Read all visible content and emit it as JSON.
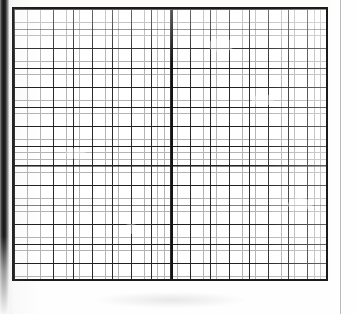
{
  "document": {
    "kind": "scanned-graph-paper",
    "title": "Blank graph paper sheet",
    "text_content": "",
    "visible_labels": [],
    "notes": "No text, numbers, axis ticks, legend or annotations are printed anywhere on this page."
  },
  "chart_data": {
    "type": "table",
    "title": "",
    "subtitle": "",
    "xlabel": "",
    "ylabel": "",
    "categories": [],
    "values": [],
    "series": [],
    "annotations": [],
    "legend_entries": [],
    "legend_position": "none",
    "grid": "on",
    "grid_description": "Empty ruled graph paper: no plotted data, curves, points or bars are present.",
    "minor_cells_horizontal": 48,
    "minor_cells_vertical": 42,
    "major_cells_horizontal": 16,
    "major_cells_vertical": 14,
    "minor_pitch_px": 6.52,
    "major_pitch_px": 19.56,
    "heavy_vertical_rule_x_px": 171
  },
  "page": {
    "width_px": 356,
    "height_px": 314,
    "background_hex": "#fdfdfc"
  },
  "grid_block": {
    "left_px": 12,
    "top_px": 7,
    "width_px": 316,
    "height_px": 274,
    "border_hex": "#1b1b1b",
    "border_width_px": 2,
    "minor_line_hex": "#b4b4b4",
    "major_line_hex": "#2a2a2a",
    "fill_hex": "#ffffff"
  },
  "artifacts": {
    "spine_shadow_hex": "#171717",
    "margin_rule_hex": "#b9b9b9",
    "center_rule_hex": "#141414",
    "blotches": [
      {
        "left_px": 206,
        "top_px": 36,
        "width_px": 26,
        "height_px": 14
      },
      {
        "left_px": 250,
        "top_px": 92,
        "width_px": 22,
        "height_px": 12
      },
      {
        "left_px": 64,
        "top_px": 146,
        "width_px": 20,
        "height_px": 11
      },
      {
        "left_px": 286,
        "top_px": 196,
        "width_px": 24,
        "height_px": 13
      },
      {
        "left_px": 120,
        "top_px": 222,
        "width_px": 18,
        "height_px": 10
      }
    ]
  }
}
